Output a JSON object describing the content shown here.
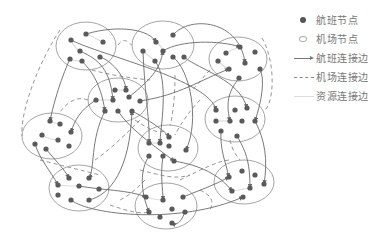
{
  "legend": {
    "items": [
      {
        "symbol": "filled-dot",
        "label": "航班节点"
      },
      {
        "symbol": "hollow-ellipse",
        "label": "机场节点"
      },
      {
        "symbol": "solid-arrow",
        "label": "航班连接边"
      },
      {
        "symbol": "dashed-line",
        "label": "机场连接边"
      },
      {
        "symbol": "light-line",
        "label": "资源连接边"
      }
    ]
  },
  "colors": {
    "flight_node": "#5a5a5a",
    "airport_outline": "#9a9a9a",
    "flight_edge": "#6a6a6a",
    "airport_edge": "#8a8a8a",
    "resource_edge": "#dcdcdc"
  },
  "airports": [
    {
      "id": "A",
      "cx": 86,
      "cy": 46,
      "rx": 30,
      "ry": 24,
      "flights": [
        [
          86,
          34
        ],
        [
          71,
          40
        ],
        [
          103,
          42
        ],
        [
          80,
          51
        ],
        [
          70,
          59
        ],
        [
          82,
          61
        ],
        [
          100,
          57
        ]
      ]
    },
    {
      "id": "B",
      "cx": 163,
      "cy": 45,
      "rx": 31,
      "ry": 24,
      "flights": [
        [
          156,
          42
        ],
        [
          173,
          35
        ],
        [
          143,
          51
        ],
        [
          163,
          51
        ],
        [
          155,
          61
        ],
        [
          173,
          57
        ],
        [
          184,
          57
        ]
      ]
    },
    {
      "id": "C",
      "cx": 238,
      "cy": 59,
      "rx": 29,
      "ry": 22,
      "flights": [
        [
          226,
          53
        ],
        [
          240,
          47
        ],
        [
          255,
          52
        ],
        [
          218,
          61
        ],
        [
          229,
          69
        ],
        [
          245,
          63
        ],
        [
          260,
          69
        ],
        [
          239,
          78
        ]
      ]
    },
    {
      "id": "D",
      "cx": 118,
      "cy": 100,
      "rx": 30,
      "ry": 22,
      "flights": [
        [
          115,
          90
        ],
        [
          126,
          90
        ],
        [
          96,
          100
        ],
        [
          113,
          100
        ],
        [
          129,
          97
        ],
        [
          140,
          101
        ],
        [
          105,
          111
        ],
        [
          118,
          111
        ],
        [
          132,
          111
        ]
      ]
    },
    {
      "id": "E",
      "cx": 52,
      "cy": 136,
      "rx": 30,
      "ry": 23,
      "flights": [
        [
          50,
          121
        ],
        [
          60,
          124
        ],
        [
          42,
          135
        ],
        [
          58,
          140
        ],
        [
          71,
          132
        ],
        [
          35,
          144
        ],
        [
          46,
          149
        ],
        [
          69,
          146
        ]
      ]
    },
    {
      "id": "F",
      "cx": 235,
      "cy": 119,
      "rx": 30,
      "ry": 23,
      "flights": [
        [
          216,
          110
        ],
        [
          235,
          110
        ],
        [
          247,
          108
        ],
        [
          216,
          121
        ],
        [
          230,
          121
        ],
        [
          242,
          121
        ],
        [
          255,
          121
        ],
        [
          221,
          131
        ],
        [
          237,
          136
        ]
      ]
    },
    {
      "id": "G",
      "cx": 168,
      "cy": 148,
      "rx": 30,
      "ry": 23,
      "flights": [
        [
          149,
          143
        ],
        [
          160,
          143
        ],
        [
          169,
          137
        ],
        [
          169,
          146
        ],
        [
          186,
          150
        ],
        [
          149,
          156
        ],
        [
          163,
          156
        ],
        [
          174,
          161
        ]
      ]
    },
    {
      "id": "H",
      "cx": 79,
      "cy": 188,
      "rx": 30,
      "ry": 23,
      "flights": [
        [
          69,
          178
        ],
        [
          89,
          178
        ],
        [
          58,
          185
        ],
        [
          79,
          186
        ],
        [
          99,
          189
        ],
        [
          58,
          195
        ],
        [
          71,
          200
        ],
        [
          89,
          200
        ]
      ]
    },
    {
      "id": "I",
      "cx": 166,
      "cy": 206,
      "rx": 31,
      "ry": 23,
      "flights": [
        [
          146,
          197
        ],
        [
          163,
          200
        ],
        [
          183,
          197
        ],
        [
          149,
          212
        ],
        [
          172,
          209
        ],
        [
          185,
          212
        ],
        [
          160,
          217
        ],
        [
          172,
          223
        ]
      ]
    },
    {
      "id": "J",
      "cx": 244,
      "cy": 182,
      "rx": 30,
      "ry": 22,
      "flights": [
        [
          229,
          177
        ],
        [
          242,
          171
        ],
        [
          255,
          175
        ],
        [
          232,
          191
        ],
        [
          250,
          188
        ],
        [
          264,
          184
        ],
        [
          243,
          197
        ]
      ]
    }
  ],
  "flight_edges": [
    "M86,34 C120,24 150,30 156,42",
    "M71,40 C100,55 210,80 216,110",
    "M173,35 C190,15 240,20 245,63",
    "M143,51 C145,100 150,120 149,143",
    "M163,51 C180,40 220,40 240,47",
    "M155,61 C170,80 160,130 160,143",
    "M173,57 C190,70 200,120 186,150",
    "M184,57 C200,70 240,80 247,108",
    "M80,51 C100,60 110,70 113,100",
    "M82,61 C90,70 100,80 105,111",
    "M100,57 C110,60 125,75 126,90",
    "M70,59 C60,80 52,110 50,121",
    "M129,97 C150,80 160,70 163,51",
    "M140,101 C180,95 200,80 229,69",
    "M118,111 C130,130 160,150 174,161",
    "M132,111 C140,115 165,130 169,137",
    "M96,100 C80,110 75,120 71,132",
    "M105,111 C90,140 95,170 89,178",
    "M35,144 C40,160 50,170 58,185",
    "M46,149 C55,160 65,170 69,178",
    "M89,200 C110,195 130,170 132,111",
    "M79,186 C100,190 130,190 146,197",
    "M71,200 C90,215 180,225 243,197",
    "M149,156 C140,170 140,190 149,212",
    "M163,156 C160,175 163,190 163,200",
    "M183,197 C200,190 215,185 229,177",
    "M174,161 C200,165 220,175 232,191",
    "M221,131 C220,150 225,160 229,177",
    "M237,136 C245,150 250,160 250,188",
    "M255,121 C265,140 268,160 264,184",
    "M260,69 C265,80 262,100 255,121",
    "M239,78 C230,90 225,100 230,121",
    "M185,212 C180,225 175,225 172,223"
  ],
  "airport_edges": [
    "M60,30 C40,60 20,110 22,136",
    "M118,45 C125,35 130,45 132,45",
    "M92,70 C110,75 130,78 150,80",
    "M88,100 C75,95 65,105 60,112",
    "M175,75 C175,100 172,120 170,125",
    "M210,70 C200,80 195,90 190,90",
    "M200,100 C190,110 180,125 175,135",
    "M262,38 C275,60 275,100 265,110",
    "M135,120 C150,130 160,135 165,130",
    "M95,160 C110,150 130,130 140,120",
    "M40,160 C60,165 80,170 100,175",
    "M110,205 C125,210 140,215 150,212",
    "M180,180 C200,170 220,160 230,160",
    "M200,190 C210,195 215,200 210,210",
    "M145,180 C135,190 130,195 120,200",
    "M230,140 C232,150 236,155 240,160",
    "M140,170 C160,175 175,180 190,175"
  ],
  "resource_edges": [
    "M86,34 C92,36 98,40 103,42",
    "M71,40 C73,45 76,49 80,51",
    "M70,59 C74,61 78,61 82,61",
    "M156,42 C160,45 162,48 163,51",
    "M143,51 C148,55 152,59 155,61",
    "M226,53 C232,50 236,48 240,47",
    "M218,61 C222,65 226,68 229,69",
    "M96,100 C102,100 108,100 113,100",
    "M115,90 C120,90 122,90 126,90",
    "M50,121 C54,123 57,124 60,124",
    "M42,135 C47,138 53,140 58,140",
    "M216,121 C222,121 226,121 230,121",
    "M149,143 C153,143 157,143 160,143",
    "M58,185 C66,186 72,186 79,186",
    "M146,197 C152,199 158,200 163,200",
    "M232,191 C238,190 245,189 250,188"
  ]
}
